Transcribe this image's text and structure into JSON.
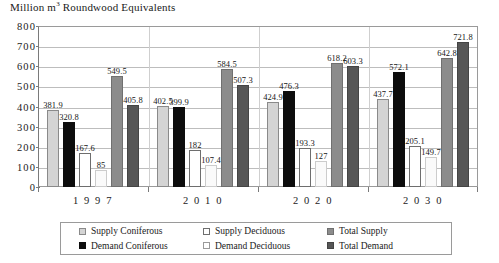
{
  "chart_data": {
    "type": "bar",
    "title": "Million m3 Roundwood Equivalents",
    "title_prefix": "Million m",
    "title_sup": "3",
    "title_suffix": " Roundwood Equivalents",
    "xlabel": "",
    "ylabel": "",
    "ylim": [
      0,
      800
    ],
    "ytick_step": 100,
    "grid": true,
    "legend_position": "bottom",
    "categories": [
      "1 9 9 7",
      "2 0 1 0",
      "2 0 2 0",
      "2 0 3 0"
    ],
    "ytick_labels": [
      "800",
      "700",
      "600",
      "500",
      "400",
      "300",
      "200",
      "100",
      "0"
    ],
    "ytick_values": [
      800,
      700,
      600,
      500,
      400,
      300,
      200,
      100,
      0
    ],
    "series": [
      {
        "name": "Supply Coniferous",
        "key": "s-coniferous",
        "color": "#d4d4d4",
        "values": [
          381.9,
          402.5,
          424.9,
          437.7
        ],
        "labels": [
          "381.9",
          "402.5",
          "424.9",
          "437.7"
        ]
      },
      {
        "name": "Demand Coniferous",
        "key": "d-coniferous",
        "color": "#0d0d0d",
        "values": [
          320.8,
          399.9,
          476.3,
          572.1
        ],
        "labels": [
          "320.8",
          "399.9",
          "476.3",
          "572.1"
        ]
      },
      {
        "name": "Supply Deciduous",
        "key": "s-deciduous",
        "color": "#ffffff",
        "values": [
          167.6,
          182,
          193.3,
          205.1
        ],
        "labels": [
          "167.6",
          "182",
          "193.3",
          "205.1"
        ]
      },
      {
        "name": "Demand Deciduous",
        "key": "d-deciduous",
        "color": "#fafafa",
        "values": [
          85,
          107.4,
          127,
          149.7
        ],
        "labels": [
          "85",
          "107.4",
          "127",
          "149.7"
        ]
      },
      {
        "name": "Total Supply",
        "key": "total-supply",
        "color": "#8c8c8c",
        "values": [
          549.5,
          584.5,
          618.2,
          642.8
        ],
        "labels": [
          "549.5",
          "584.5",
          "618.2",
          "642.8"
        ]
      },
      {
        "name": "Total Demand",
        "key": "total-demand",
        "color": "#565656",
        "values": [
          405.8,
          507.3,
          603.3,
          721.8
        ],
        "labels": [
          "405.8",
          "507.3",
          "603.3",
          "721.8"
        ]
      }
    ]
  },
  "legend": {
    "entries": [
      {
        "label": "Supply Coniferous",
        "key": "s-coniferous"
      },
      {
        "label": "Demand Coniferous",
        "key": "d-coniferous"
      },
      {
        "label": "Supply Deciduous",
        "key": "s-deciduous"
      },
      {
        "label": "Demand Deciduous",
        "key": "d-deciduous"
      },
      {
        "label": "Total Supply",
        "key": "total-supply"
      },
      {
        "label": "Total Demand",
        "key": "total-demand"
      }
    ]
  }
}
